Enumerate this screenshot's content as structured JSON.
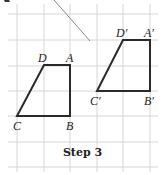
{
  "figure": {
    "caption": "Step 3",
    "colors": {
      "grid": "#d6d6d6",
      "shape_stroke": "#2a2a2a",
      "diagonal": "#8a8a8a",
      "text": "#222222",
      "background": "#ffffff"
    },
    "grid": {
      "x_lines": [
        17,
        44,
        70,
        97,
        123,
        150
      ],
      "y_lines": [
        14,
        40,
        66,
        91,
        116,
        142,
        167
      ]
    },
    "original_shape": {
      "name": "ABCD",
      "vertices": {
        "A": {
          "label": "A",
          "x": 70,
          "y": 65
        },
        "B": {
          "label": "B",
          "x": 70,
          "y": 116
        },
        "C": {
          "label": "C",
          "x": 17,
          "y": 116
        },
        "D": {
          "label": "D",
          "x": 44,
          "y": 65
        }
      }
    },
    "image_shape": {
      "name": "A'B'C'D'",
      "vertices": {
        "A": {
          "label": "A′",
          "x": 150,
          "y": 40
        },
        "B": {
          "label": "B′",
          "x": 150,
          "y": 91
        },
        "C": {
          "label": "C′",
          "x": 97,
          "y": 91
        },
        "D": {
          "label": "D′",
          "x": 123,
          "y": 40
        }
      }
    },
    "diagonal_line": {
      "x1": 54,
      "y1": 0,
      "x2": 90,
      "y2": 41
    }
  }
}
